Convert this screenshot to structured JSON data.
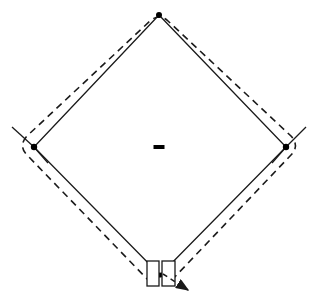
{
  "canvas": {
    "width": 318,
    "height": 304,
    "background": "#ffffff",
    "title": "Baseball Diamond Field Diagram"
  },
  "style": {
    "line_color": "#1a1a1a",
    "dash_color": "#1a1a1a",
    "marker_color": "#000000",
    "baseline_width": 1.3,
    "fence_width": 1.6,
    "fence_dash_pattern": "7,5"
  },
  "labels": {
    "figure_caption": "",
    "second_base": "2B",
    "first_base": "1B",
    "third_base": "3B",
    "home_plate": "HP",
    "pitchers_rubber": "P",
    "outfield_fence": "Outfield fence",
    "foul_line": "Foul line",
    "batters_box_left": "Left batter's box",
    "batters_box_right": "Right batter's box",
    "run_direction_arrow": "Direction of travel"
  },
  "chart_data": {
    "type": "diagram",
    "title": "Baseball Diamond Field Diagram",
    "xlim": [
      0,
      318
    ],
    "ylim": [
      0,
      304
    ],
    "bases": [
      {
        "name": "second-base",
        "x": 159,
        "y": 15,
        "marker": "dot",
        "radius": 3.0
      },
      {
        "name": "third-base",
        "x": 34,
        "y": 147,
        "marker": "dot",
        "radius": 3.2
      },
      {
        "name": "first-base",
        "x": 286,
        "y": 147,
        "marker": "dot",
        "radius": 3.2
      },
      {
        "name": "home-plate",
        "x": 160,
        "y": 275,
        "marker": "dot",
        "radius": 2.6
      }
    ],
    "pitchers_rubber": {
      "x": 159,
      "y": 147,
      "width": 11,
      "height": 4
    },
    "baselines": {
      "stroke": "solid",
      "points": [
        [
          160,
          275
        ],
        [
          34,
          147
        ],
        [
          159,
          15
        ],
        [
          286,
          147
        ],
        [
          160,
          275
        ]
      ]
    },
    "foul_line_extensions": [
      {
        "name": "third-base-extension",
        "from": [
          34,
          147
        ],
        "to": [
          12,
          127
        ]
      },
      {
        "name": "third-base-extension-inner",
        "from": [
          34,
          147
        ],
        "to": [
          48,
          163
        ]
      },
      {
        "name": "first-base-extension",
        "from": [
          286,
          147
        ],
        "to": [
          306,
          127
        ]
      },
      {
        "name": "first-base-extension-inner",
        "from": [
          286,
          147
        ],
        "to": [
          272,
          163
        ]
      }
    ],
    "outfield_fence": {
      "stroke": "dashed",
      "description": "Rounded dashed boundary just outside the baselines",
      "path": "M 151 283 L 27 155 Q 18 146 27 136 L 150 21 Q 159 13 168 21 L 291 136 Q 300 146 291 155 L 170 282"
    },
    "batters_boxes": [
      {
        "name": "left-batters-box",
        "x": 147,
        "y": 261,
        "width": 12,
        "height": 25
      },
      {
        "name": "right-batters-box",
        "x": 162,
        "y": 261,
        "width": 13,
        "height": 25
      }
    ],
    "direction_arrow": {
      "stroke": "dashed",
      "from": [
        163,
        274
      ],
      "to": [
        192,
        292
      ],
      "arrowhead": {
        "x": 192,
        "y": 292,
        "angle_deg": 32
      }
    }
  }
}
